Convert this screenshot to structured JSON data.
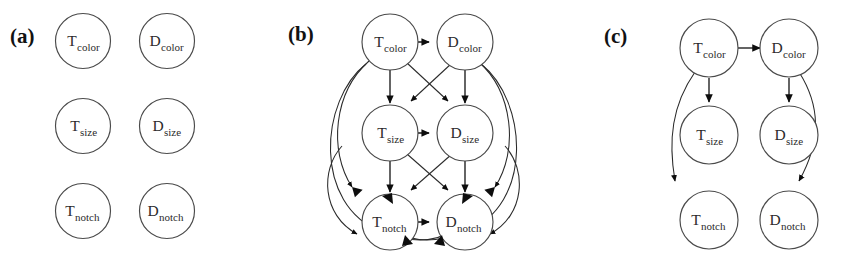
{
  "figure": {
    "type": "diagram",
    "subtype": "directed-acyclic-graph-panels",
    "background_color": "#ffffff",
    "node_fill_color": "#ffffff",
    "node_stroke_color": "#4a4a4a",
    "edge_color": "#1a1a1a",
    "text_color": "#2b2b2b",
    "panel_count": 3
  },
  "nodes": {
    "t_color": {
      "base": "T",
      "sub": "color",
      "full": "T_color"
    },
    "d_color": {
      "base": "D",
      "sub": "color",
      "full": "D_color"
    },
    "t_size": {
      "base": "T",
      "sub": "size",
      "full": "T_size"
    },
    "d_size": {
      "base": "D",
      "sub": "size",
      "full": "D_size"
    },
    "t_notch": {
      "base": "T",
      "sub": "notch",
      "full": "T_notch"
    },
    "d_notch": {
      "base": "D",
      "sub": "notch",
      "full": "D_notch"
    }
  },
  "panels": [
    {
      "id": "a",
      "label": "(a)",
      "description": "Empty graph - six isolated nodes, no edges",
      "edge_count": 0,
      "nodes": [
        "T_color",
        "D_color",
        "T_size",
        "D_size",
        "T_notch",
        "D_notch"
      ],
      "edges": []
    },
    {
      "id": "b",
      "label": "(b)",
      "description": "Fully connected graph - all feasible directed edges present",
      "edge_count": 12,
      "nodes": [
        "T_color",
        "D_color",
        "T_size",
        "D_size",
        "T_notch",
        "D_notch"
      ],
      "edges": [
        {
          "from": "T_color",
          "to": "D_color"
        },
        {
          "from": "T_color",
          "to": "T_size"
        },
        {
          "from": "T_color",
          "to": "D_size"
        },
        {
          "from": "T_color",
          "to": "T_notch"
        },
        {
          "from": "T_color",
          "to": "D_notch"
        },
        {
          "from": "D_color",
          "to": "T_size"
        },
        {
          "from": "D_color",
          "to": "D_size"
        },
        {
          "from": "D_color",
          "to": "T_notch"
        },
        {
          "from": "D_color",
          "to": "D_notch"
        },
        {
          "from": "T_size",
          "to": "D_size"
        },
        {
          "from": "T_size",
          "to": "T_notch"
        },
        {
          "from": "T_size",
          "to": "D_notch"
        },
        {
          "from": "D_size",
          "to": "T_notch"
        },
        {
          "from": "D_size",
          "to": "D_notch"
        },
        {
          "from": "T_notch",
          "to": "D_notch"
        }
      ]
    },
    {
      "id": "c",
      "label": "(c)",
      "description": "Sparse graph - colour drives size and notch within each column",
      "edge_count": 5,
      "nodes": [
        "T_color",
        "D_color",
        "T_size",
        "D_size",
        "T_notch",
        "D_notch"
      ],
      "edges": [
        {
          "from": "T_color",
          "to": "D_color"
        },
        {
          "from": "T_color",
          "to": "T_size"
        },
        {
          "from": "T_color",
          "to": "T_notch"
        },
        {
          "from": "D_color",
          "to": "D_size"
        },
        {
          "from": "D_color",
          "to": "D_notch"
        }
      ]
    }
  ]
}
